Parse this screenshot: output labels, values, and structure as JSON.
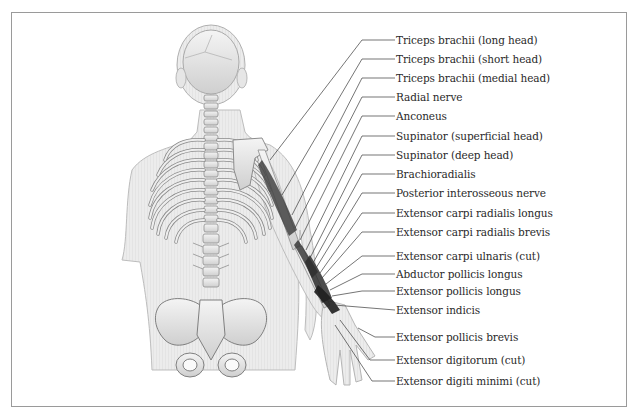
{
  "figure": {
    "border_color": "#9a9a9a",
    "labels": [
      {
        "text": "Triceps brachii (long head)",
        "y": 40
      },
      {
        "text": "Triceps brachii (short head)",
        "y": 59
      },
      {
        "text": "Triceps brachii (medial head)",
        "y": 78
      },
      {
        "text": "Radial nerve",
        "y": 96
      },
      {
        "text": "Anconeus",
        "y": 116
      },
      {
        "text": "Supinator (superficial head)",
        "y": 136
      },
      {
        "text": "Supinator (deep head)",
        "y": 155
      },
      {
        "text": "Brachioradialis",
        "y": 174
      },
      {
        "text": "Posterior interosseous nerve",
        "y": 193
      },
      {
        "text": "Extensor carpi radialis longus",
        "y": 213
      },
      {
        "text": "Extensor carpi radialis brevis",
        "y": 232
      },
      {
        "text": "Extensor carpi ulnaris (cut)",
        "y": 256
      },
      {
        "text": "Abductor pollicis longus",
        "y": 274
      },
      {
        "text": "Extensor pollicis longus",
        "y": 291
      },
      {
        "text": "Extensor indicis",
        "y": 310
      },
      {
        "text": "Extensor pollicis brevis",
        "y": 337
      },
      {
        "text": "Extensor digitorum (cut)",
        "y": 360
      },
      {
        "text": "Extensor digiti minimi (cut)",
        "y": 381
      }
    ]
  }
}
